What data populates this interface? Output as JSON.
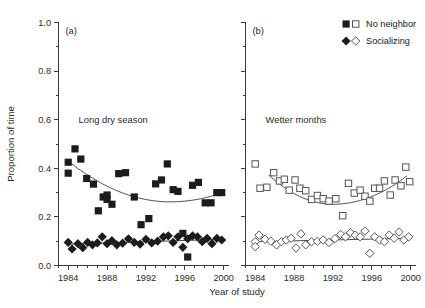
{
  "chart_data": {
    "type": "scatter",
    "title": "",
    "xlabel": "Year of study",
    "ylabel": "Proportion of time",
    "xlim": [
      1983,
      2000.5
    ],
    "ylim": [
      0.0,
      1.0
    ],
    "grid": false,
    "legend_position": "top-right",
    "x_ticks_major": [
      1984,
      1988,
      1992,
      1996,
      2000
    ],
    "x_ticks_major_labels": [
      "1984",
      "1988",
      "1992",
      "1996",
      "2000"
    ],
    "x_ticks_minor_step": 1,
    "y_ticks_major": [
      0.0,
      0.2,
      0.4,
      0.6,
      0.8,
      1.0
    ],
    "y_ticks_major_labels": [
      "0.0",
      "0.2",
      "0.4",
      "0.6",
      "0.8",
      "1.0"
    ],
    "y_ticks_minor_step": 0.1,
    "legend": [
      {
        "label": "No neighbor",
        "marker_filled": "square",
        "marker_open": "square"
      },
      {
        "label": "Socializing",
        "marker_filled": "diamond",
        "marker_open": "diamond"
      }
    ],
    "panels": [
      {
        "id": "a",
        "panel_label": "(a)",
        "annotation": "Long dry season",
        "marker_style": "filled",
        "series": [
          {
            "name": "No neighbor",
            "marker": "square",
            "x": [
              1984.0,
              1984.0,
              1984.7,
              1985.3,
              1985.9,
              1986.6,
              1987.1,
              1987.6,
              1988.0,
              1988.0,
              1988.5,
              1989.2,
              1989.9,
              1990.8,
              1991.5,
              1992.3,
              1993.0,
              1993.6,
              1994.2,
              1994.8,
              1995.3,
              1995.8,
              1996.3,
              1996.8,
              1997.4,
              1998.1,
              1998.7,
              1999.3,
              1999.8
            ],
            "y": [
              0.425,
              0.38,
              0.48,
              0.438,
              0.358,
              0.335,
              0.225,
              0.282,
              0.272,
              0.29,
              0.252,
              0.378,
              0.382,
              0.282,
              0.168,
              0.193,
              0.336,
              0.352,
              0.418,
              0.312,
              0.305,
              0.132,
              0.035,
              0.33,
              0.342,
              0.258,
              0.258,
              0.3,
              0.3
            ]
          },
          {
            "name": "Socializing",
            "marker": "diamond",
            "x": [
              1984.0,
              1984.4,
              1985.0,
              1985.5,
              1986.0,
              1986.5,
              1987.0,
              1987.5,
              1988.0,
              1988.5,
              1989.0,
              1989.6,
              1990.2,
              1990.8,
              1991.4,
              1992.0,
              1992.6,
              1993.2,
              1993.8,
              1994.3,
              1994.8,
              1995.3,
              1995.8,
              1996.3,
              1996.8,
              1997.3,
              1997.8,
              1998.3,
              1998.8,
              1999.3,
              1999.8
            ],
            "y": [
              0.095,
              0.068,
              0.09,
              0.073,
              0.095,
              0.085,
              0.093,
              0.118,
              0.09,
              0.102,
              0.085,
              0.092,
              0.11,
              0.095,
              0.088,
              0.108,
              0.093,
              0.1,
              0.118,
              0.122,
              0.095,
              0.118,
              0.075,
              0.11,
              0.122,
              0.118,
              0.098,
              0.112,
              0.09,
              0.112,
              0.105
            ]
          }
        ],
        "trend_no_neighbor": {
          "type": "quadratic",
          "x_start": 1984.0,
          "x_end": 1999.9,
          "y_start": 0.43,
          "y_min": 0.262,
          "x_min": 1994.5,
          "y_end": 0.3
        },
        "trend_socializing": {
          "type": "linear",
          "x_start": 1984.0,
          "x_end": 1999.9,
          "y_start": 0.088,
          "y_end": 0.108
        }
      },
      {
        "id": "b",
        "panel_label": "(b)",
        "annotation": "Wetter months",
        "marker_style": "open",
        "series": [
          {
            "name": "No neighbor",
            "marker": "square",
            "x": [
              1984.0,
              1984.5,
              1985.2,
              1985.9,
              1986.5,
              1987.0,
              1987.5,
              1988.1,
              1988.6,
              1989.2,
              1989.8,
              1990.4,
              1991.0,
              1991.6,
              1992.3,
              1993.0,
              1993.6,
              1994.2,
              1994.8,
              1995.3,
              1995.8,
              1996.3,
              1996.8,
              1997.3,
              1997.9,
              1998.4,
              1999.0,
              1999.5,
              1999.9
            ],
            "y": [
              0.418,
              0.318,
              0.322,
              0.382,
              0.348,
              0.355,
              0.31,
              0.352,
              0.318,
              0.308,
              0.272,
              0.288,
              0.275,
              0.265,
              0.275,
              0.205,
              0.338,
              0.298,
              0.31,
              0.285,
              0.265,
              0.318,
              0.318,
              0.348,
              0.29,
              0.352,
              0.328,
              0.405,
              0.345
            ]
          },
          {
            "name": "Socializing",
            "marker": "diamond",
            "x": [
              1984.0,
              1984.0,
              1984.4,
              1985.0,
              1985.6,
              1986.2,
              1986.7,
              1987.2,
              1987.7,
              1988.2,
              1988.7,
              1989.2,
              1989.8,
              1990.4,
              1991.0,
              1991.6,
              1992.2,
              1992.8,
              1993.3,
              1993.8,
              1994.3,
              1994.8,
              1995.3,
              1995.8,
              1996.3,
              1996.8,
              1997.3,
              1997.8,
              1998.3,
              1998.8,
              1999.3,
              1999.8
            ],
            "y": [
              0.098,
              0.078,
              0.125,
              0.108,
              0.1,
              0.085,
              0.098,
              0.105,
              0.112,
              0.072,
              0.13,
              0.085,
              0.098,
              0.1,
              0.105,
              0.095,
              0.11,
              0.128,
              0.118,
              0.135,
              0.125,
              0.118,
              0.142,
              0.05,
              0.118,
              0.105,
              0.098,
              0.125,
              0.112,
              0.138,
              0.105,
              0.118
            ]
          }
        ],
        "trend_no_neighbor": {
          "type": "quadratic",
          "x_start": 1985.4,
          "x_end": 1999.6,
          "y_start": 0.372,
          "y_min": 0.252,
          "x_min": 1992.0,
          "y_end": 0.368
        },
        "trend_socializing": {
          "type": "linear",
          "x_start": 1984.0,
          "x_end": 1999.8,
          "y_start": 0.098,
          "y_end": 0.112
        }
      }
    ]
  }
}
